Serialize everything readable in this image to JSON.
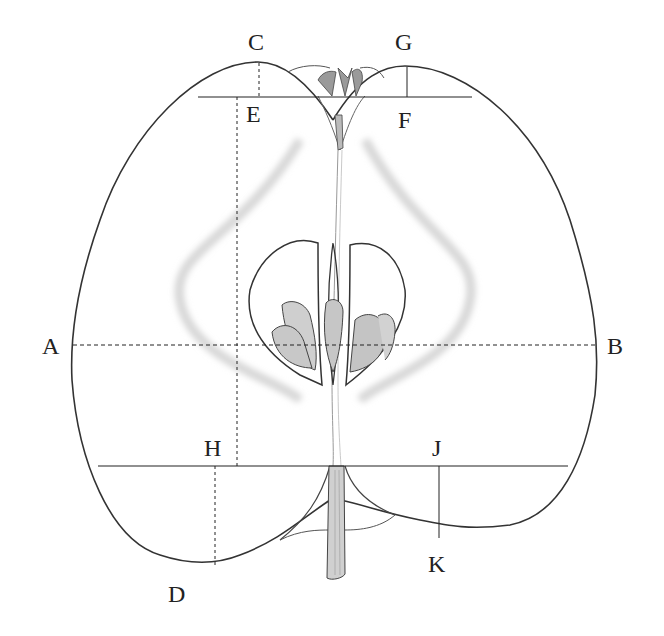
{
  "diagram": {
    "labels": [
      {
        "id": "A",
        "text": "A",
        "x": 42,
        "y": 334
      },
      {
        "id": "B",
        "text": "B",
        "x": 607,
        "y": 334
      },
      {
        "id": "C",
        "text": "C",
        "x": 248,
        "y": 30
      },
      {
        "id": "D",
        "text": "D",
        "x": 168,
        "y": 582
      },
      {
        "id": "E",
        "text": "E",
        "x": 246,
        "y": 102
      },
      {
        "id": "F",
        "text": "F",
        "x": 398,
        "y": 108
      },
      {
        "id": "G",
        "text": "G",
        "x": 395,
        "y": 30
      },
      {
        "id": "H",
        "text": "H",
        "x": 204,
        "y": 436
      },
      {
        "id": "J",
        "text": "J",
        "x": 432,
        "y": 436
      },
      {
        "id": "K",
        "text": "K",
        "x": 428,
        "y": 552
      }
    ],
    "colors": {
      "outline": "#333333",
      "seed_fill": "#c8c8c8",
      "core_shadow": "#d8d8d8",
      "stem": "#d0d0d0"
    }
  }
}
